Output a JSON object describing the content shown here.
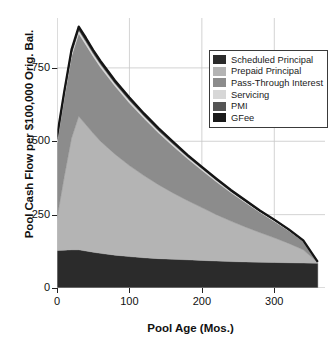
{
  "chart_data": {
    "type": "area",
    "title": "",
    "xlabel": "Pool Age (Mos.)",
    "ylabel": "Pool Cash Flow per $100,000 Orig. Bal.",
    "xlim": [
      0,
      370
    ],
    "ylim": [
      0,
      920
    ],
    "xticks": [
      0,
      100,
      200,
      300
    ],
    "yticks": [
      0,
      250,
      500,
      750
    ],
    "xticklabels": [
      "0",
      "100",
      "200",
      "300"
    ],
    "yticklabels": [
      "0",
      "250",
      "500",
      "750"
    ],
    "grid": true,
    "grid_color": "#c8c8c8",
    "stacked": true,
    "legend_position": "upper right",
    "x": [
      0,
      10,
      20,
      30,
      40,
      50,
      60,
      80,
      100,
      120,
      140,
      160,
      180,
      200,
      220,
      240,
      260,
      280,
      300,
      320,
      340,
      360
    ],
    "series": [
      {
        "name": "Scheduled Principal",
        "color": "#2b2b2b",
        "values": [
          128,
          129,
          130,
          130,
          126,
          122,
          118,
          112,
          107,
          103,
          100,
          98,
          96,
          94,
          92,
          90,
          89,
          88,
          87,
          86,
          85,
          84
        ]
      },
      {
        "name": "Prepaid Principal",
        "color": "#b4b4b4",
        "values": [
          110,
          250,
          380,
          455,
          430,
          405,
          382,
          344,
          310,
          280,
          252,
          226,
          202,
          180,
          158,
          138,
          119,
          101,
          84,
          66,
          45,
          3
        ]
      },
      {
        "name": "Pass-Through Interest",
        "color": "#8c8c8c",
        "values": [
          256,
          268,
          278,
          282,
          272,
          262,
          252,
          232,
          213,
          195,
          177,
          160,
          143,
          127,
          112,
          97,
          83,
          69,
          56,
          43,
          29,
          2
        ]
      },
      {
        "name": "Servicing",
        "color": "#d7d7d7",
        "values": [
          10,
          11,
          11,
          11,
          11,
          10,
          10,
          9,
          9,
          8,
          7,
          7,
          6,
          6,
          5,
          4,
          4,
          3,
          3,
          2,
          1,
          0
        ]
      },
      {
        "name": "PMI",
        "color": "#555555",
        "values": [
          4,
          4,
          4,
          4,
          4,
          4,
          4,
          3,
          3,
          3,
          3,
          3,
          2,
          2,
          2,
          2,
          1,
          1,
          1,
          1,
          1,
          0
        ]
      },
      {
        "name": "GFee",
        "color": "#1a1a1a",
        "values": [
          8,
          8,
          9,
          9,
          9,
          8,
          8,
          7,
          7,
          6,
          6,
          5,
          5,
          4,
          4,
          3,
          3,
          2,
          2,
          2,
          1,
          0
        ]
      }
    ],
    "legend": [
      {
        "label": "Scheduled Principal",
        "color": "#2b2b2b"
      },
      {
        "label": "Prepaid Principal",
        "color": "#b4b4b4"
      },
      {
        "label": "Pass-Through Interest",
        "color": "#8c8c8c"
      },
      {
        "label": "Servicing",
        "color": "#d7d7d7"
      },
      {
        "label": "PMI",
        "color": "#555555"
      },
      {
        "label": "GFee",
        "color": "#1a1a1a"
      }
    ]
  }
}
